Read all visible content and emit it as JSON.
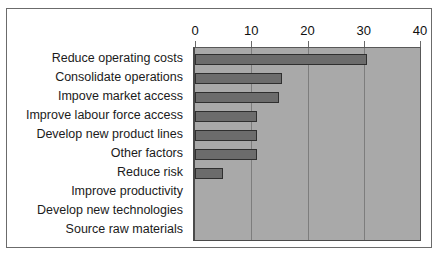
{
  "chart_data": {
    "type": "bar",
    "orientation": "horizontal",
    "title": "",
    "subtitle": "",
    "xlabel": "",
    "ylabel": "",
    "xlim": [
      0,
      40
    ],
    "xticks": [
      0,
      10,
      20,
      30,
      40
    ],
    "xtick_labels": [
      "0",
      "10",
      "20",
      "30",
      "40"
    ],
    "grid": true,
    "grid_axis": "x",
    "legend": false,
    "legend_position": "none",
    "categories": [
      "Reduce operating costs",
      "Consolidate operations",
      "Impove market access",
      "Improve labour force access",
      "Develop new product lines",
      "Other factors",
      "Reduce risk",
      "Improve productivity",
      "Develop new technologies",
      "Source raw materials"
    ],
    "values": [
      30.5,
      15.5,
      15,
      11,
      11,
      11,
      5,
      0,
      0,
      0
    ],
    "series": [
      {
        "name": "",
        "values": [
          30.5,
          15.5,
          15,
          11,
          11,
          11,
          5,
          0,
          0,
          0
        ]
      }
    ],
    "colors": {
      "bar_fill": "#6c6c6c",
      "bar_border": "#2f2f2f",
      "plot_background": "#a9a9a9",
      "gridline": "#7d7d7d",
      "axis_line": "#4a4a4a",
      "frame_border": "#6b6b6b",
      "page_background": "#ffffff",
      "text": "#1b1b1b"
    }
  }
}
